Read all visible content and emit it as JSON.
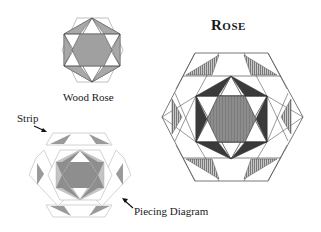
{
  "title": "Rose",
  "blocks": {
    "wood_rose": {
      "label": "Wood Rose"
    },
    "rose": {
      "label": "Rose"
    },
    "piecing": {
      "strip_label": "Strip",
      "diagram_label": "Piecing Diagram"
    }
  },
  "colors": {
    "outline": "#555555",
    "light_outline": "#b8b8b8",
    "dark_fill": "#3c3c3c",
    "medium_fill": "#8a8a8a",
    "light_fill": "#a6a6a6",
    "stripe_fill": "#9a9a9a",
    "background": "#ffffff"
  }
}
